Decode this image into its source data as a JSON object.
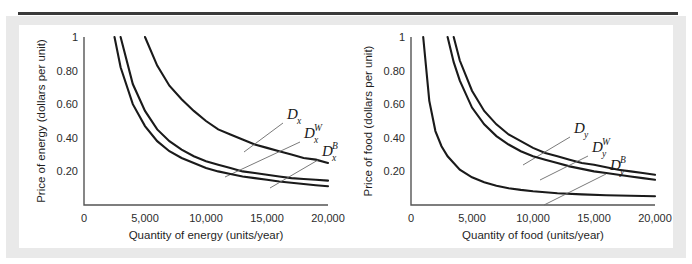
{
  "figure": {
    "background_color": "#ffffff",
    "mat_color": "#e9e9e9",
    "rule_color": "#3a3a3a",
    "curve_color": "#1a1a1a",
    "axis_color": "#545454",
    "leader_color": "#6b6b6b"
  },
  "chart_data": [
    {
      "type": "line",
      "panel_id": "a",
      "caption": "(a) Energy market",
      "title": "",
      "xlabel": "Quantity of energy (units/year)",
      "ylabel": "Price of energy (dollars per unit)",
      "xlim": [
        0,
        20000
      ],
      "ylim": [
        0,
        1
      ],
      "grid": false,
      "legend_position": "inline-annotations",
      "xticks": [
        0,
        5000,
        10000,
        15000,
        20000
      ],
      "xticklabels": [
        "0",
        "5,000",
        "10,000",
        "15,000",
        "20,000"
      ],
      "yticks": [
        0,
        0.2,
        0.4,
        0.6,
        0.8,
        1
      ],
      "yticklabels": [
        "0",
        "0.20",
        "0.40",
        "0.60",
        "0.80",
        "1"
      ],
      "series": [
        {
          "name": "D_x",
          "label_base": "D",
          "label_sub": "x",
          "label_sup": "",
          "description": "market demand for energy",
          "x": [
            5000,
            6000,
            7000,
            8000,
            9000,
            10000,
            11000,
            12000,
            13000,
            14000,
            15000,
            16000,
            17000,
            18000,
            19000,
            20000
          ],
          "y": [
            1.0,
            0.83,
            0.71,
            0.63,
            0.56,
            0.5,
            0.45,
            0.42,
            0.39,
            0.36,
            0.34,
            0.32,
            0.3,
            0.28,
            0.27,
            0.25
          ]
        },
        {
          "name": "D_x^W",
          "label_base": "D",
          "label_sub": "x",
          "label_sup": "W",
          "description": "white consumer demand for energy",
          "x": [
            3000,
            4000,
            5000,
            6000,
            7000,
            8000,
            9000,
            10000,
            11000,
            12000,
            13000,
            14000,
            15000,
            16000,
            17000,
            18000,
            19000,
            20000
          ],
          "y": [
            1.0,
            0.72,
            0.56,
            0.45,
            0.38,
            0.33,
            0.29,
            0.26,
            0.24,
            0.22,
            0.2,
            0.19,
            0.18,
            0.17,
            0.16,
            0.155,
            0.15,
            0.145
          ]
        },
        {
          "name": "D_x^B",
          "label_base": "D",
          "label_sub": "x",
          "label_sup": "B",
          "description": "black consumer demand for energy",
          "x": [
            2500,
            3000,
            4000,
            5000,
            6000,
            7000,
            8000,
            9000,
            10000,
            11000,
            12000,
            13000,
            14000,
            15000,
            16000,
            17000,
            18000,
            19000,
            20000
          ],
          "y": [
            1.0,
            0.82,
            0.6,
            0.47,
            0.38,
            0.32,
            0.28,
            0.25,
            0.22,
            0.2,
            0.185,
            0.17,
            0.16,
            0.15,
            0.14,
            0.132,
            0.125,
            0.118,
            0.112
          ]
        }
      ]
    },
    {
      "type": "line",
      "panel_id": "b",
      "caption": "(b) Food market",
      "title": "",
      "xlabel": "Quantity of food (units/year)",
      "ylabel": "Price of food (dollars per unit)",
      "xlim": [
        0,
        20000
      ],
      "ylim": [
        0,
        1
      ],
      "grid": false,
      "legend_position": "inline-annotations",
      "xticks": [
        0,
        5000,
        10000,
        15000,
        20000
      ],
      "xticklabels": [
        "0",
        "5,000",
        "10,000",
        "15,000",
        "20,000"
      ],
      "yticks": [
        0,
        0.2,
        0.4,
        0.6,
        0.8,
        1
      ],
      "yticklabels": [
        "0",
        "0.20",
        "0.40",
        "0.60",
        "0.80",
        "1"
      ],
      "series": [
        {
          "name": "D_y",
          "label_base": "D",
          "label_sub": "y",
          "label_sup": "",
          "description": "market demand for food",
          "x": [
            3500,
            4000,
            5000,
            6000,
            7000,
            8000,
            9000,
            10000,
            11000,
            12000,
            13000,
            14000,
            15000,
            16000,
            17000,
            18000,
            19000,
            20000
          ],
          "y": [
            1.0,
            0.86,
            0.68,
            0.56,
            0.48,
            0.42,
            0.38,
            0.34,
            0.31,
            0.29,
            0.27,
            0.25,
            0.24,
            0.225,
            0.21,
            0.2,
            0.19,
            0.18
          ]
        },
        {
          "name": "D_y^W",
          "label_base": "D",
          "label_sub": "y",
          "label_sup": "W",
          "description": "white consumer demand for food",
          "x": [
            3000,
            3500,
            4000,
            5000,
            6000,
            7000,
            8000,
            9000,
            10000,
            11000,
            12000,
            13000,
            14000,
            15000,
            16000,
            17000,
            18000,
            19000,
            20000
          ],
          "y": [
            1.0,
            0.85,
            0.74,
            0.58,
            0.48,
            0.41,
            0.36,
            0.32,
            0.29,
            0.27,
            0.25,
            0.23,
            0.215,
            0.2,
            0.19,
            0.18,
            0.17,
            0.16,
            0.15
          ]
        },
        {
          "name": "D_y^B",
          "label_base": "D",
          "label_sub": "y",
          "label_sup": "B",
          "description": "black consumer demand for food",
          "x": [
            1000,
            1500,
            2000,
            2500,
            3000,
            4000,
            5000,
            6000,
            7000,
            8000,
            9000,
            10000,
            12000,
            14000,
            16000,
            18000,
            20000
          ],
          "y": [
            1.0,
            0.62,
            0.44,
            0.35,
            0.29,
            0.21,
            0.165,
            0.135,
            0.115,
            0.1,
            0.09,
            0.082,
            0.07,
            0.063,
            0.058,
            0.055,
            0.052
          ]
        }
      ]
    }
  ]
}
